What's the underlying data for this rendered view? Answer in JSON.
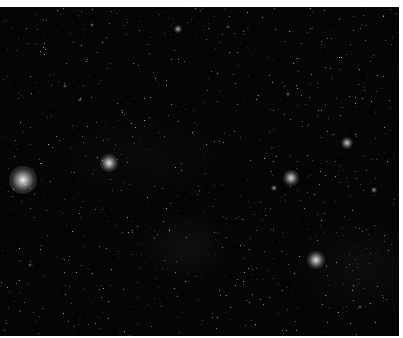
{
  "image": {
    "subject": "star field",
    "background_color": "#050505",
    "margin_color": "#ffffff"
  },
  "bright_stars": [
    {
      "x": 23,
      "y": 173,
      "r": 14,
      "glow": 0.95
    },
    {
      "x": 109,
      "y": 156,
      "r": 9,
      "glow": 0.9
    },
    {
      "x": 178,
      "y": 22,
      "r": 4,
      "glow": 0.7
    },
    {
      "x": 291,
      "y": 171,
      "r": 8,
      "glow": 0.85
    },
    {
      "x": 347,
      "y": 136,
      "r": 6,
      "glow": 0.8
    },
    {
      "x": 316,
      "y": 253,
      "r": 9,
      "glow": 0.9
    },
    {
      "x": 274,
      "y": 181,
      "r": 3,
      "glow": 0.6
    },
    {
      "x": 374,
      "y": 183,
      "r": 3,
      "glow": 0.6
    },
    {
      "x": 288,
      "y": 87,
      "r": 2,
      "glow": 0.5
    },
    {
      "x": 92,
      "y": 18,
      "r": 2,
      "glow": 0.5
    },
    {
      "x": 65,
      "y": 79,
      "r": 2,
      "glow": 0.45
    },
    {
      "x": 80,
      "y": 93,
      "r": 2,
      "glow": 0.45
    },
    {
      "x": 30,
      "y": 258,
      "r": 2,
      "glow": 0.5
    },
    {
      "x": 360,
      "y": 300,
      "r": 2,
      "glow": 0.45
    },
    {
      "x": 228,
      "y": 20,
      "r": 2,
      "glow": 0.4
    }
  ],
  "dust_count": 1400,
  "dust_seed": 7
}
